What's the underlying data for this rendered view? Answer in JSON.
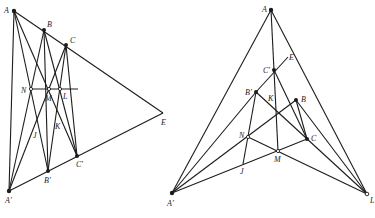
{
  "figures": [
    {
      "id": "left",
      "title": "Desargues configuration (left)",
      "points": {
        "A": {
          "label": "A",
          "x": 14,
          "y": 11,
          "style": "filled"
        },
        "B": {
          "label": "B",
          "x": 44,
          "y": 30,
          "style": "filled"
        },
        "C": {
          "label": "C",
          "x": 66,
          "y": 45,
          "style": "filled"
        },
        "E": {
          "label": "E",
          "x": 163,
          "y": 113,
          "style": "none"
        },
        "A'": {
          "label": "A'",
          "x": 9,
          "y": 191,
          "style": "filled"
        },
        "B'": {
          "label": "B'",
          "x": 48,
          "y": 171,
          "style": "filled"
        },
        "C'": {
          "label": "C'",
          "x": 77,
          "y": 156,
          "style": "filled"
        },
        "N": {
          "label": "N",
          "x": 31,
          "y": 89,
          "style": "open"
        },
        "M": {
          "label": "M",
          "x": 49,
          "y": 89,
          "style": "open"
        },
        "L": {
          "label": "L",
          "x": 60,
          "y": 89,
          "style": "open"
        },
        "J": {
          "label": "J",
          "x": 35,
          "y": 135,
          "style": "none"
        },
        "K": {
          "label": "K",
          "x": 58,
          "y": 128,
          "style": "none"
        }
      },
      "labels": [
        {
          "text": "A",
          "x": 4,
          "y": 13
        },
        {
          "text": "B",
          "x": 47,
          "y": 27
        },
        {
          "text": "C",
          "x": 70,
          "y": 43
        },
        {
          "text": "N",
          "x": 21,
          "y": 93
        },
        {
          "text": "M",
          "x": 45,
          "y": 101
        },
        {
          "text": "L",
          "x": 63,
          "y": 99
        },
        {
          "text": "J",
          "x": 33,
          "y": 138
        },
        {
          "text": "K",
          "x": 55,
          "y": 129
        },
        {
          "text": "E",
          "x": 161,
          "y": 125
        },
        {
          "text": "C'",
          "x": 76,
          "y": 167
        },
        {
          "text": "B'",
          "x": 44,
          "y": 183
        },
        {
          "text": "A'",
          "x": 5,
          "y": 203
        }
      ]
    },
    {
      "id": "right",
      "title": "Desargues configuration (right)",
      "points": {
        "A": {
          "label": "A",
          "x": 271,
          "y": 10,
          "style": "filled"
        },
        "E": {
          "label": "E",
          "x": 288,
          "y": 57,
          "style": "none"
        },
        "C'": {
          "label": "C'",
          "x": 274,
          "y": 70,
          "style": "filled"
        },
        "B'": {
          "label": "B'",
          "x": 256,
          "y": 92,
          "style": "filled"
        },
        "B": {
          "label": "B",
          "x": 296,
          "y": 100,
          "style": "filled"
        },
        "K": {
          "label": "K",
          "x": 270,
          "y": 98,
          "style": "none"
        },
        "N": {
          "label": "N",
          "x": 248,
          "y": 137,
          "style": "open"
        },
        "M": {
          "label": "M",
          "x": 278,
          "y": 151,
          "style": "open"
        },
        "C": {
          "label": "C",
          "x": 307,
          "y": 139,
          "style": "filled"
        },
        "J": {
          "label": "J",
          "x": 243,
          "y": 164,
          "style": "none"
        },
        "A'": {
          "label": "A'",
          "x": 172,
          "y": 193,
          "style": "filled"
        },
        "L": {
          "label": "L",
          "x": 367,
          "y": 194,
          "style": "open"
        }
      },
      "labels": [
        {
          "text": "A",
          "x": 262,
          "y": 12
        },
        {
          "text": "E",
          "x": 289,
          "y": 60
        },
        {
          "text": "C'",
          "x": 263,
          "y": 73
        },
        {
          "text": "B'",
          "x": 245,
          "y": 95
        },
        {
          "text": "K",
          "x": 268,
          "y": 101
        },
        {
          "text": "B",
          "x": 301,
          "y": 102
        },
        {
          "text": "N",
          "x": 239,
          "y": 138
        },
        {
          "text": "C",
          "x": 311,
          "y": 141
        },
        {
          "text": "M",
          "x": 274,
          "y": 162
        },
        {
          "text": "J",
          "x": 240,
          "y": 174
        },
        {
          "text": "A'",
          "x": 167,
          "y": 206
        },
        {
          "text": "L",
          "x": 370,
          "y": 203
        }
      ]
    }
  ]
}
